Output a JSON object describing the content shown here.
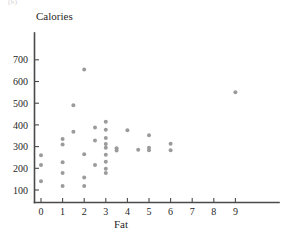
{
  "figure": {
    "header_fragment": "(b)",
    "background_color": "#ffffff",
    "point_color": "#9b9b9b",
    "axis_color": "#4a4a4a"
  },
  "axes": {
    "y_title": "Calories",
    "x_title": "Fat",
    "y_ticks": [
      "100",
      "200",
      "300",
      "400",
      "500",
      "600",
      "700"
    ],
    "x_ticks": [
      "0",
      "1",
      "2",
      "3",
      "4",
      "5",
      "6",
      "7",
      "8",
      "9"
    ]
  },
  "chart_data": {
    "type": "scatter",
    "title": "",
    "xlabel": "Fat",
    "ylabel": "Calories",
    "xlim": [
      -0.45,
      9.9
    ],
    "ylim": [
      40,
      760
    ],
    "grid": false,
    "legend": "none",
    "x_ticks": [
      0,
      1,
      2,
      3,
      4,
      5,
      6,
      7,
      8,
      9
    ],
    "y_ticks": [
      100,
      200,
      300,
      400,
      500,
      600,
      700
    ],
    "series": [
      {
        "name": "Fast food items",
        "marker": "circle",
        "color": "#9b9b9b",
        "points": [
          {
            "x": 0,
            "y": 260
          },
          {
            "x": 0,
            "y": 215
          },
          {
            "x": 0,
            "y": 140
          },
          {
            "x": 1,
            "y": 335
          },
          {
            "x": 1,
            "y": 310
          },
          {
            "x": 1,
            "y": 228
          },
          {
            "x": 1,
            "y": 178
          },
          {
            "x": 1,
            "y": 118
          },
          {
            "x": 1.5,
            "y": 490
          },
          {
            "x": 1.5,
            "y": 368
          },
          {
            "x": 2,
            "y": 655
          },
          {
            "x": 2,
            "y": 265
          },
          {
            "x": 2,
            "y": 158
          },
          {
            "x": 2,
            "y": 118
          },
          {
            "x": 2.5,
            "y": 388
          },
          {
            "x": 2.5,
            "y": 328
          },
          {
            "x": 2.5,
            "y": 215
          },
          {
            "x": 3,
            "y": 415
          },
          {
            "x": 3,
            "y": 378
          },
          {
            "x": 3,
            "y": 340
          },
          {
            "x": 3,
            "y": 312
          },
          {
            "x": 3,
            "y": 295
          },
          {
            "x": 3,
            "y": 262
          },
          {
            "x": 3,
            "y": 230
          },
          {
            "x": 3,
            "y": 198
          },
          {
            "x": 3,
            "y": 178
          },
          {
            "x": 3.5,
            "y": 292
          },
          {
            "x": 3.5,
            "y": 282
          },
          {
            "x": 4,
            "y": 375
          },
          {
            "x": 4.5,
            "y": 285
          },
          {
            "x": 5,
            "y": 352
          },
          {
            "x": 5,
            "y": 295
          },
          {
            "x": 5,
            "y": 283
          },
          {
            "x": 6,
            "y": 313
          },
          {
            "x": 6,
            "y": 283
          },
          {
            "x": 9,
            "y": 550
          }
        ]
      }
    ]
  }
}
